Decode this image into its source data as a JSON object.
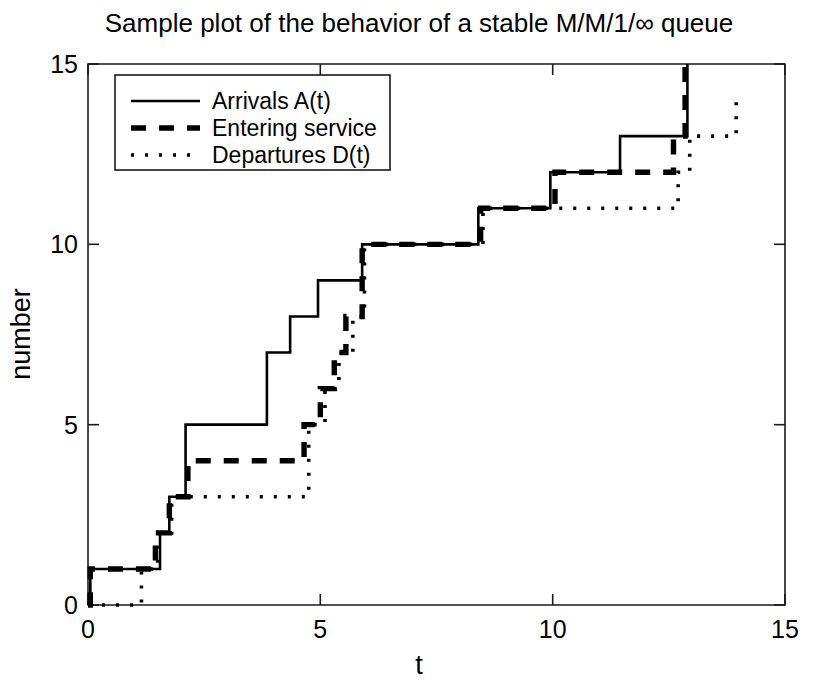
{
  "chart_data": {
    "type": "line",
    "title": "Sample plot of the behavior of a stable M/M/1/∞ queue",
    "xlabel": "t",
    "ylabel": "number",
    "xlim": [
      0,
      15
    ],
    "ylim": [
      0,
      15
    ],
    "xticks": [
      0,
      5,
      10,
      15
    ],
    "yticks": [
      0,
      5,
      10,
      15
    ],
    "xtick_labels": [
      "0",
      "5",
      "10",
      "15"
    ],
    "ytick_labels": [
      "0",
      "5",
      "10",
      "15"
    ],
    "grid": false,
    "legend_position": "upper left",
    "step_style": "post",
    "series": [
      {
        "name": "Arrivals A(t)",
        "style": "solid",
        "x": [
          0.0,
          0.05,
          0.9,
          1.55,
          1.75,
          2.1,
          3.85,
          4.35,
          4.95,
          5.9,
          7.7,
          8.4,
          9.95,
          11.45,
          12.65,
          12.9,
          12.9
        ],
        "y": [
          0,
          1,
          1,
          2,
          3,
          5,
          7,
          8,
          9,
          10,
          10,
          11,
          12,
          13,
          13,
          14,
          15
        ]
      },
      {
        "name": "Entering service",
        "style": "dashed",
        "x": [
          0.0,
          0.05,
          1.1,
          1.45,
          1.75,
          2.15,
          4.35,
          4.65,
          5.0,
          5.3,
          5.55,
          5.9,
          7.75,
          8.45,
          10.05,
          11.5,
          12.6,
          12.85,
          12.85
        ],
        "y": [
          0,
          1,
          1,
          2,
          3,
          4,
          4,
          5,
          6,
          7,
          8,
          10,
          10,
          11,
          12,
          12,
          13,
          13,
          15
        ]
      },
      {
        "name": "Departures D(t)",
        "style": "dotted",
        "x": [
          0.0,
          1.15,
          1.15,
          1.5,
          1.8,
          4.4,
          4.75,
          5.1,
          5.4,
          5.7,
          5.95,
          8.45,
          8.5,
          11.5,
          12.7,
          12.95,
          13.95,
          13.95
        ],
        "y": [
          0,
          0,
          1,
          2,
          3,
          3,
          5,
          6,
          7,
          8,
          10,
          10,
          11,
          11,
          12,
          13,
          13,
          14
        ]
      }
    ],
    "legend_entries": [
      {
        "label": "Arrivals A(t)",
        "style": "solid"
      },
      {
        "label": "Entering service",
        "style": "dashed"
      },
      {
        "label": "Departures D(t)",
        "style": "dotted"
      }
    ]
  }
}
